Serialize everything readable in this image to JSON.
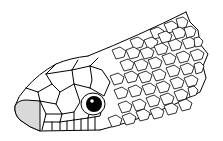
{
  "image": {
    "subject": "snake head line illustration",
    "colors": {
      "line": "#000000",
      "background": "#ffffff",
      "rostral_fill": "#d9d9d9",
      "eye": "#000000"
    }
  }
}
